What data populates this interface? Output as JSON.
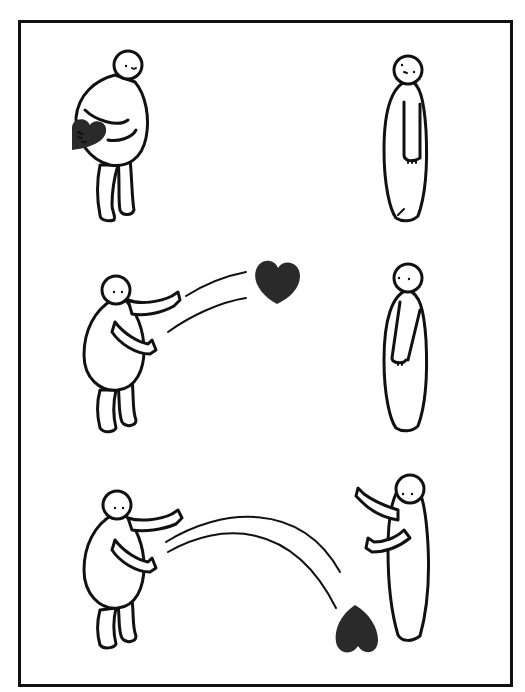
{
  "comic": {
    "panels": [
      {
        "id": 1,
        "description": "Left figure hugs a heart; right figure stands facing away"
      },
      {
        "id": 2,
        "description": "Left figure throws the heart toward the right figure"
      },
      {
        "id": 3,
        "description": "Right figure reaches out; heart lands on the ground between them"
      }
    ],
    "colors": {
      "line": "#111111",
      "heart": "#2a2a2a",
      "background": "#ffffff"
    }
  }
}
